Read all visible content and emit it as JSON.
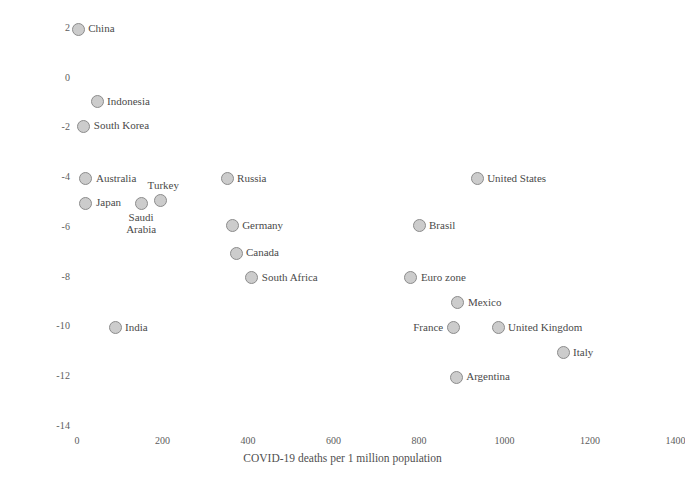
{
  "chart_data": {
    "type": "scatter",
    "title": "",
    "xlabel": "COVID-19 deaths per 1 million population",
    "ylabel": "2020 IMF forecast for real GDP growth",
    "xlim": [
      0,
      1400
    ],
    "ylim": [
      -14,
      2
    ],
    "xticks": [
      "0",
      "200",
      "400",
      "600",
      "800",
      "1000",
      "1200",
      "1400"
    ],
    "yticks": [
      "2",
      "0",
      "-2",
      "-4",
      "-6",
      "-8",
      "-10",
      "-12",
      "-14"
    ],
    "grid": false,
    "legend": "none",
    "marker_fill": "#cccccc",
    "marker_edge": "#8c8c8c",
    "points": [
      {
        "label": "China",
        "x": 3,
        "y": 1.9,
        "label_pos": "right"
      },
      {
        "label": "Indonesia",
        "x": 47,
        "y": -1.0,
        "label_pos": "right"
      },
      {
        "label": "South Korea",
        "x": 16,
        "y": -2.0,
        "label_pos": "right"
      },
      {
        "label": "Australia",
        "x": 21,
        "y": -4.1,
        "label_pos": "right"
      },
      {
        "label": "Japan",
        "x": 21,
        "y": -5.1,
        "label_pos": "right"
      },
      {
        "label": "Saudi Arabia",
        "x": 150,
        "y": -5.1,
        "label_pos": "below2"
      },
      {
        "label": "Turkey",
        "x": 196,
        "y": -5.0,
        "label_pos": "above"
      },
      {
        "label": "Russia",
        "x": 351,
        "y": -4.1,
        "label_pos": "right"
      },
      {
        "label": "Germany",
        "x": 363,
        "y": -6.0,
        "label_pos": "right"
      },
      {
        "label": "Canada",
        "x": 372,
        "y": -7.1,
        "label_pos": "right"
      },
      {
        "label": "South Africa",
        "x": 409,
        "y": -8.1,
        "label_pos": "right"
      },
      {
        "label": "India",
        "x": 89,
        "y": -10.1,
        "label_pos": "right"
      },
      {
        "label": "Brasil",
        "x": 800,
        "y": -6.0,
        "label_pos": "right"
      },
      {
        "label": "Euro zone",
        "x": 781,
        "y": -8.1,
        "label_pos": "right"
      },
      {
        "label": "United States",
        "x": 936,
        "y": -4.1,
        "label_pos": "right"
      },
      {
        "label": "Mexico",
        "x": 891,
        "y": -9.1,
        "label_pos": "right"
      },
      {
        "label": "France",
        "x": 880,
        "y": -10.1,
        "label_pos": "left"
      },
      {
        "label": "United Kingdom",
        "x": 985,
        "y": -10.1,
        "label_pos": "right"
      },
      {
        "label": "Italy",
        "x": 1137,
        "y": -11.1,
        "label_pos": "right"
      },
      {
        "label": "Argentina",
        "x": 887,
        "y": -12.1,
        "label_pos": "right"
      }
    ]
  }
}
